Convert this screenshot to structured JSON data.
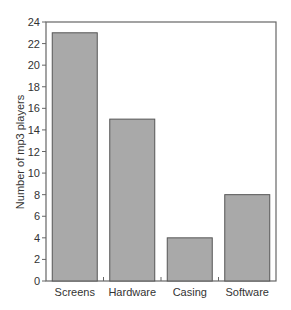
{
  "chart_data": {
    "type": "bar",
    "title": "",
    "xlabel": "",
    "ylabel": "Number of mp3 players",
    "categories": [
      "Screens",
      "Hardware",
      "Casing",
      "Software"
    ],
    "values": [
      23,
      15,
      4,
      8
    ],
    "ylim": [
      0,
      24
    ],
    "yticks": [
      0,
      2,
      4,
      6,
      8,
      10,
      12,
      14,
      16,
      18,
      20,
      22,
      24
    ],
    "grid": false,
    "legend": null,
    "colors": {
      "bar_fill": "#a9a9a9",
      "bar_stroke": "#555555",
      "axis": "#666666"
    }
  }
}
